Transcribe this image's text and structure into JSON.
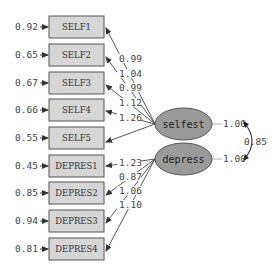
{
  "colors": {
    "box_fill": "#d6d6d6",
    "box_stroke": "#555555",
    "latent_fill": "#9a9a9a",
    "latent_stroke": "#555555",
    "arrow": "#444444",
    "text": "#444444"
  },
  "observed": [
    {
      "name": "SELF1",
      "error": "0.92"
    },
    {
      "name": "SELF2",
      "error": "0.65"
    },
    {
      "name": "SELF3",
      "error": "0.67"
    },
    {
      "name": "SELF4",
      "error": "0.66"
    },
    {
      "name": "SELF5",
      "error": "0.55"
    },
    {
      "name": "DEPRES1",
      "error": "0.45"
    },
    {
      "name": "DEPRES2",
      "error": "0.85"
    },
    {
      "name": "DEPRES3",
      "error": "0.94"
    },
    {
      "name": "DEPRES4",
      "error": "0.81"
    }
  ],
  "latent": [
    {
      "name": "selfest",
      "variance": "1.00"
    },
    {
      "name": "depress",
      "variance": "1.00"
    }
  ],
  "loadings": {
    "selfest": [
      "0.99",
      "1.04",
      "0.99",
      "1.12",
      "1.26"
    ],
    "depress": [
      "1.23",
      "0.87",
      "1.06",
      "1.10"
    ]
  },
  "covariance": "0.85"
}
